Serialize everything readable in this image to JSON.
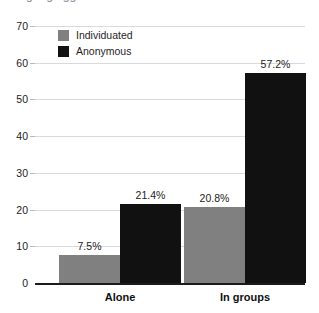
{
  "chart_data": {
    "type": "bar",
    "title": "",
    "xlabel": "",
    "ylabel": "",
    "ylim": [
      0,
      70
    ],
    "ytick_labels": [
      "0",
      "10",
      "20",
      "30",
      "40",
      "50",
      "60",
      "70"
    ],
    "yticks": [
      0,
      10,
      20,
      30,
      40,
      50,
      60,
      70
    ],
    "grid": true,
    "legend_position": "top-left",
    "categories": [
      "Alone",
      "In groups"
    ],
    "series": [
      {
        "name": "Individuated",
        "color": "#808080",
        "values": [
          7.5,
          20.8
        ],
        "labels": [
          "7.5%",
          "20.8%"
        ]
      },
      {
        "name": "Anonymous",
        "color": "#111111",
        "values": [
          21.4,
          57.2
        ],
        "labels": [
          "21.4%",
          "57.2%"
        ]
      }
    ]
  },
  "legend": {
    "items": [
      {
        "label": "Individuated",
        "swatch": "individuated"
      },
      {
        "label": "Anonymous",
        "swatch": "anonymous"
      }
    ]
  },
  "title_clip": "gang aggression"
}
